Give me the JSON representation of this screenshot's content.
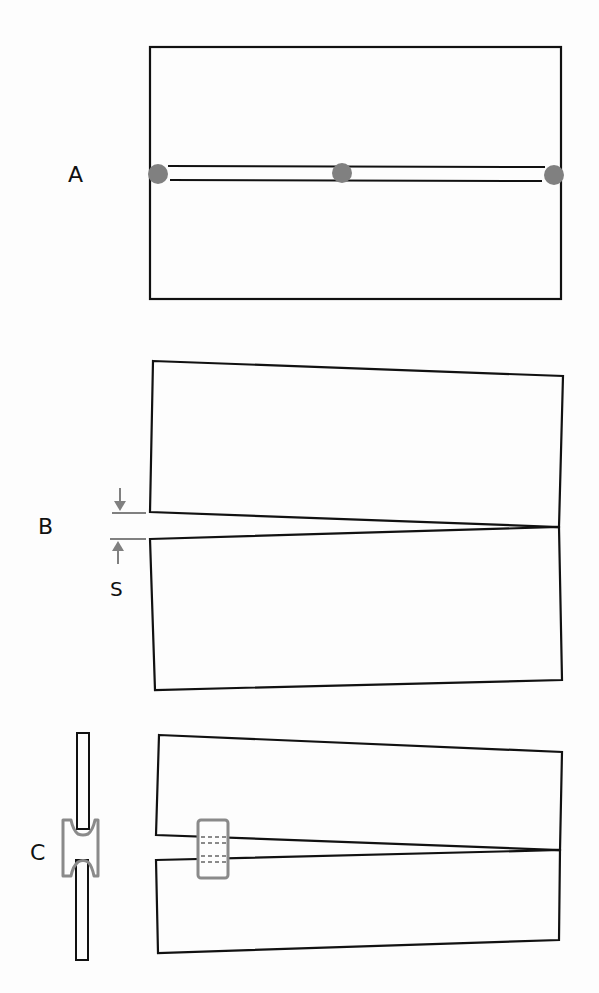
{
  "figure": {
    "panels": [
      {
        "id": "A",
        "label": "A",
        "description": "Rectangular plate with central slot; three gray points along slot axis"
      },
      {
        "id": "B",
        "label": "B",
        "description": "Two wedge halves hinged at right end, opening gap at left",
        "gap_label": "S"
      },
      {
        "id": "C",
        "label": "C",
        "description": "Wedge halves with gray clip spanning gap; side view of clip on edge"
      }
    ],
    "colors": {
      "line": "#111111",
      "accent_gray": "#808080",
      "background": "#fdfdfd"
    }
  }
}
